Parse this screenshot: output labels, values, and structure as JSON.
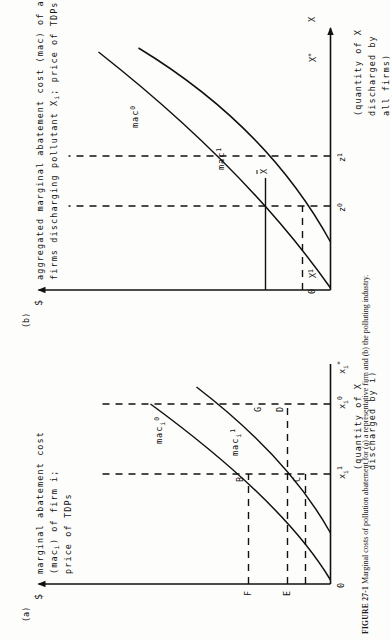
{
  "figure": {
    "caption_label": "FIGURE 27-1",
    "caption_text": "Marginal costs of pollution abatement for (a) a representative firm and (b) the polluting industry.",
    "panel_markers": {
      "a": "(a)",
      "b": "(b)"
    }
  },
  "panel_a": {
    "y_axis": {
      "currency": "$",
      "line1": "marginal abatement cost",
      "line2": "(mac",
      "line2_sub": "i",
      "line2_end": ") of firm i;",
      "line3": "price of TDPs"
    },
    "x_axis": {
      "line1": "(quantity of X",
      "line2": "discharged by i)",
      "origin": "0",
      "ticks": [
        "x",
        "x",
        "x"
      ],
      "tick_subs": [
        "i",
        "i",
        "i"
      ],
      "tick_sups": [
        "1",
        "0",
        "*"
      ]
    },
    "curves": [
      {
        "name": "mac",
        "sub": "i",
        "sup": "0"
      },
      {
        "name": "mac",
        "sub": "i",
        "sup": "1"
      }
    ],
    "points": [
      "B",
      "C",
      "G",
      "D",
      "F",
      "E"
    ]
  },
  "panel_b": {
    "y_axis": {
      "currency": "$",
      "line1": "aggregated marginal abatement cost (mac) of all",
      "line2_a": "firms discharging pollutant X",
      "line2_sub": "i",
      "line2_b": "; price of TDPs"
    },
    "x_axis": {
      "line1": "(quantity of X",
      "line2": "discharged by",
      "line3": "all firms)",
      "origin": "0",
      "ticks": [
        "X",
        "X",
        "X"
      ],
      "tick_sups": [
        "1",
        "*",
        ""
      ],
      "tick_bar": "X"
    },
    "curves": [
      {
        "name": "mac",
        "sup": "0"
      },
      {
        "name": "mac",
        "sup": "1"
      }
    ],
    "points": [
      "z",
      "z"
    ],
    "point_sups": [
      "0",
      "1"
    ],
    "axis_arrow_label": "X"
  },
  "colors": {
    "ink": "#111111",
    "paper": "#fdfdfb"
  }
}
